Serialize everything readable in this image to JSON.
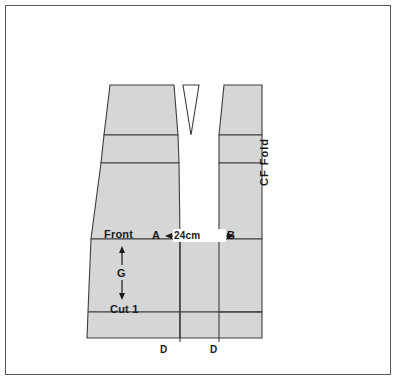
{
  "diagram": {
    "colors": {
      "piece_fill": "#d5d6d6",
      "line": "#3d3d3f",
      "border": "#58585a",
      "background": "#ffffff",
      "text": "#1a1a1a"
    },
    "labels": {
      "front": "Front",
      "point_a": "A",
      "dimension": "24cm",
      "point_b": "B",
      "grainline": "G",
      "cut": "Cut 1",
      "notch_left": "D",
      "notch_right": "D",
      "cf_fold": "CF Fold"
    },
    "measurements": {
      "a_to_b": "24cm"
    },
    "pieces": [
      {
        "name": "front-panel-left",
        "label": "Front",
        "cut_instruction": "Cut 1"
      },
      {
        "name": "dart-wedge",
        "label": ""
      },
      {
        "name": "front-panel-right",
        "label": ""
      }
    ]
  }
}
